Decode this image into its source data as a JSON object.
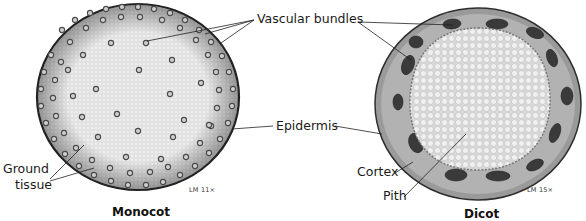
{
  "figure": {
    "panels": [
      {
        "id": "monocot",
        "caption": "Monocot",
        "magnification": "LM 11×",
        "labels": [
          "Ground tissue"
        ]
      },
      {
        "id": "dicot",
        "caption": "Dicot",
        "magnification": "LM 15×",
        "labels": [
          "Cortex",
          "Pith"
        ]
      }
    ],
    "shared_labels": [
      "Vascular bundles",
      "Epidermis"
    ]
  },
  "labels": {
    "vascular_bundles": "Vascular bundles",
    "epidermis": "Epidermis",
    "ground_tissue_line1": "Ground",
    "ground_tissue_line2": "tissue",
    "cortex": "Cortex",
    "pith": "Pith",
    "monocot_caption": "Monocot",
    "dicot_caption": "Dicot",
    "monocot_mag": "LM 11×",
    "dicot_mag": "LM 15×"
  },
  "colors": {
    "background": "#ffffff",
    "monocot_fill": "#ececec",
    "monocot_edge": "#2a2a2a",
    "bundle_ring": "#555555",
    "dicot_outer": "#8a8a8a",
    "dicot_cortex": "#a9a9a9",
    "dicot_bundle": "#3e3e3e",
    "dicot_pith": "#e6e6e6",
    "leader_line": "#222222"
  }
}
